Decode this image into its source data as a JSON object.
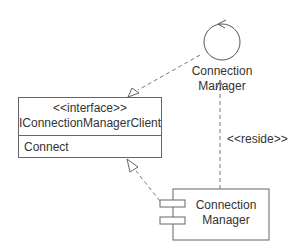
{
  "interface": {
    "stereotype": "<<interface>>",
    "name": "IConnectionManagerClient",
    "operations": [
      "Connect"
    ]
  },
  "control": {
    "label_line1": "Connection",
    "label_line2": "Manager"
  },
  "component": {
    "label_line1": "Connection",
    "label_line2": "Manager"
  },
  "dependency": {
    "label": "<<reside>>"
  },
  "colors": {
    "line": "#666666",
    "text": "#333333"
  }
}
